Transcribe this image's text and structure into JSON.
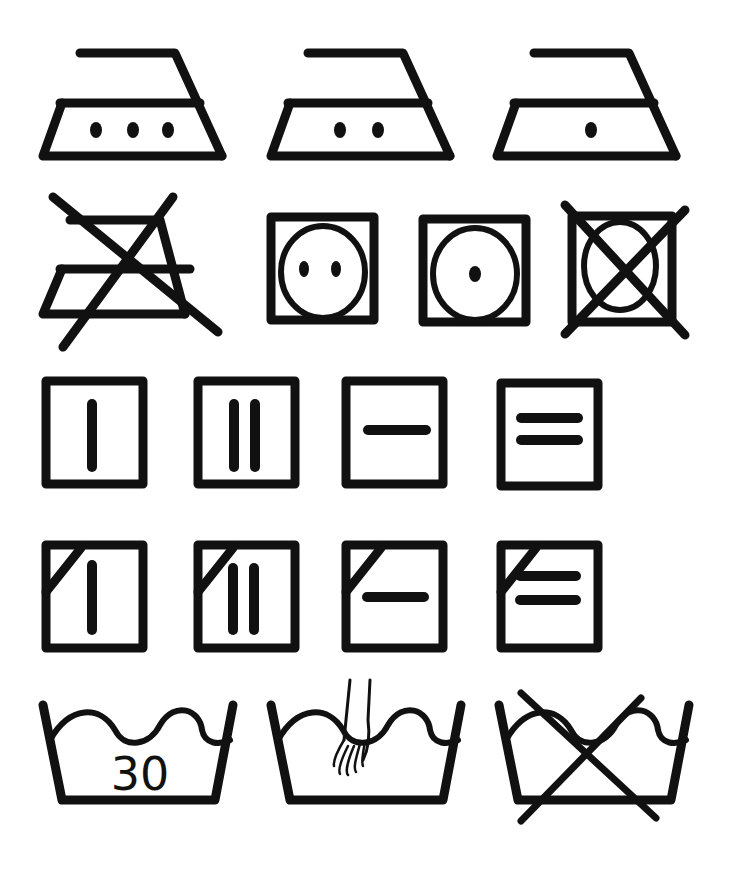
{
  "colors": {
    "ink": "#111111",
    "background": "#ffffff"
  },
  "rows": [
    {
      "name": "ironing",
      "symbols": [
        {
          "id": "iron-high",
          "meaning": "Iron at high temperature",
          "dots": 3
        },
        {
          "id": "iron-medium",
          "meaning": "Iron at medium temperature",
          "dots": 2
        },
        {
          "id": "iron-low",
          "meaning": "Iron at low temperature",
          "dots": 1
        }
      ]
    },
    {
      "name": "ironing-and-tumble-dry",
      "symbols": [
        {
          "id": "do-not-iron",
          "meaning": "Do not iron"
        },
        {
          "id": "tumble-dry-normal",
          "meaning": "Tumble dry, normal heat",
          "dots": 2
        },
        {
          "id": "tumble-dry-low",
          "meaning": "Tumble dry, low heat",
          "dots": 1
        },
        {
          "id": "do-not-tumble-dry",
          "meaning": "Do not tumble dry"
        }
      ]
    },
    {
      "name": "natural-drying",
      "symbols": [
        {
          "id": "line-dry",
          "meaning": "Line dry"
        },
        {
          "id": "drip-dry",
          "meaning": "Drip dry"
        },
        {
          "id": "dry-flat",
          "meaning": "Dry flat"
        },
        {
          "id": "drip-dry-flat",
          "meaning": "Drip dry flat"
        }
      ]
    },
    {
      "name": "natural-drying-in-shade",
      "symbols": [
        {
          "id": "line-dry-shade",
          "meaning": "Line dry in shade"
        },
        {
          "id": "drip-dry-shade",
          "meaning": "Drip dry in shade"
        },
        {
          "id": "dry-flat-shade",
          "meaning": "Dry flat in shade"
        },
        {
          "id": "drip-dry-flat-shade",
          "meaning": "Drip dry flat in shade"
        }
      ]
    },
    {
      "name": "washing",
      "symbols": [
        {
          "id": "wash-30",
          "meaning": "Machine wash at 30°C",
          "label": "30"
        },
        {
          "id": "hand-wash",
          "meaning": "Hand wash"
        },
        {
          "id": "do-not-wash",
          "meaning": "Do not wash"
        }
      ]
    }
  ]
}
